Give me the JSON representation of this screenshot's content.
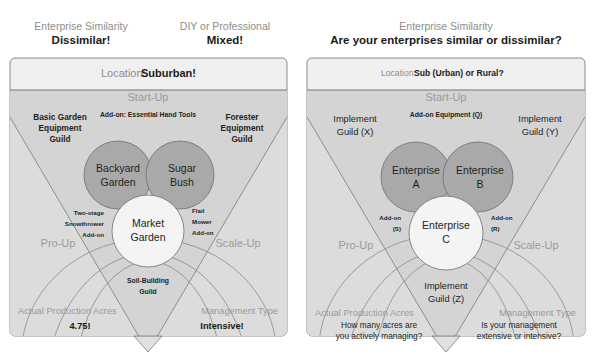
{
  "left_panel": {
    "headers": [
      {
        "sub": "Enterprise Similarity",
        "main": "Dissimilar!"
      },
      {
        "sub": "DIY or Professional",
        "main": "Mixed!"
      }
    ],
    "location_label": "Location:",
    "location_value": "Suburban!",
    "stage_top": "Start-Up",
    "stage_left": "Pro-Up",
    "stage_right": "Scale-Up",
    "guild_left": [
      "Basic Garden",
      "Equipment",
      "Guild"
    ],
    "guild_right": [
      "Forester",
      "Equipment",
      "Guild"
    ],
    "addon_top": "Add-on: Essential Hand Tools",
    "addon_left": [
      "Two-stage",
      "Snowthrower",
      "Add-on"
    ],
    "addon_right": [
      "Flail",
      "Mower",
      "Add-on"
    ],
    "guild_bottom": [
      "Soil-Building",
      "Guild"
    ],
    "circles": [
      {
        "name": "circle-backyard-garden",
        "lines": [
          "Backyard",
          "Garden"
        ]
      },
      {
        "name": "circle-sugar-bush",
        "lines": [
          "Sugar",
          "Bush"
        ]
      },
      {
        "name": "circle-market-garden",
        "lines": [
          "Market",
          "Garden"
        ]
      }
    ],
    "footer_left_label": "Actual Production Acres",
    "footer_left_value": "4.75!",
    "footer_right_label": "Management Type",
    "footer_right_value": "Intensive!"
  },
  "right_panel": {
    "headers": [
      {
        "sub": "Enterprise Similarity",
        "main": "Are your enterprises similar or dissimilar?"
      }
    ],
    "location_label": "Location:",
    "location_value": "Sub (Urban) or Rural?",
    "stage_top": "Start-Up",
    "stage_left": "Pro-Up",
    "stage_right": "Scale-Up",
    "guild_left": [
      "Implement",
      "Guild (X)"
    ],
    "guild_right": [
      "Implement",
      "Guild (Y)"
    ],
    "addon_top": "Add-on Equipment (Q)",
    "addon_left": [
      "Add-on",
      "(S)"
    ],
    "addon_right": [
      "Add-on",
      "(R)"
    ],
    "guild_bottom": [
      "Implement",
      "Guild (Z)"
    ],
    "circles": [
      {
        "name": "circle-enterprise-a",
        "lines": [
          "Enterprise",
          "A"
        ]
      },
      {
        "name": "circle-enterprise-b",
        "lines": [
          "Enterprise",
          "B"
        ]
      },
      {
        "name": "circle-enterprise-c",
        "lines": [
          "Enterprise",
          "C"
        ]
      }
    ],
    "footer_left_label": "Actual Production Acres",
    "footer_left_value_lines": [
      "How many acres are",
      "you actively managing?"
    ],
    "footer_right_label": "Management Type",
    "footer_right_value_lines": [
      "Is your management",
      "extensive or intensive?"
    ]
  },
  "colors": {
    "frame_fill": "#f0f0f0",
    "frame_stroke": "#6f6f6f",
    "triangle_fill": "#cfcfcf",
    "circle_dark": "#a9a9a9",
    "circle_light": "#f4f4f4",
    "muted_text": "#8d8d8d",
    "body_text": "#231f20"
  }
}
